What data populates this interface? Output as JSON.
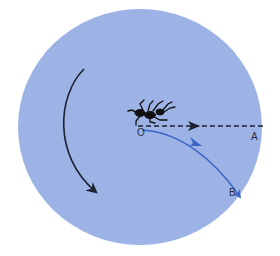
{
  "diagram": {
    "type": "ant-orientation-diagram",
    "background_color": "#ffffff",
    "disc_color": "#9db3e6",
    "rotation_arrow": {
      "direction": "clockwise",
      "color": "#1c2230"
    },
    "straight_path": {
      "style": "dashed",
      "color": "#1c2230",
      "from": "O",
      "to": "A"
    },
    "curved_path": {
      "style": "solid",
      "color": "#3a64c8",
      "from": "O",
      "to": "B"
    },
    "labels": {
      "origin": "O",
      "point_a": "A",
      "point_b": "B"
    },
    "figure": "ant"
  }
}
